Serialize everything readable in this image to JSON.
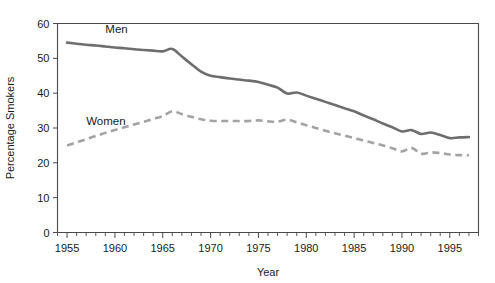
{
  "chart_data": {
    "type": "line",
    "title": "",
    "xlabel": "Year",
    "ylabel": "Percentage Smokers",
    "xlim": [
      1954,
      1998
    ],
    "ylim": [
      0,
      60
    ],
    "grid": false,
    "legend_position": "inline-annotation",
    "y_ticks": [
      0,
      10,
      20,
      30,
      40,
      50,
      60
    ],
    "x_ticks": [
      1955,
      1960,
      1965,
      1970,
      1975,
      1980,
      1985,
      1990,
      1995
    ],
    "x_minor_tick_interval": 1,
    "x": [
      1955,
      1956,
      1957,
      1958,
      1959,
      1960,
      1961,
      1962,
      1963,
      1964,
      1965,
      1966,
      1967,
      1968,
      1969,
      1970,
      1971,
      1972,
      1973,
      1974,
      1975,
      1976,
      1977,
      1978,
      1979,
      1980,
      1981,
      1982,
      1983,
      1984,
      1985,
      1986,
      1987,
      1988,
      1989,
      1990,
      1991,
      1992,
      1993,
      1994,
      1995,
      1996,
      1997
    ],
    "series": [
      {
        "name": "Men",
        "label": "Men",
        "style": "solid",
        "color": "#6e6e6e",
        "values": [
          54.5,
          54.2,
          53.9,
          53.7,
          53.4,
          53.1,
          52.9,
          52.6,
          52.4,
          52.2,
          52.0,
          52.7,
          50.5,
          48.3,
          46.2,
          45.0,
          44.6,
          44.2,
          43.9,
          43.6,
          43.2,
          42.4,
          41.6,
          39.9,
          40.2,
          39.3,
          38.4,
          37.5,
          36.6,
          35.7,
          34.8,
          33.6,
          32.5,
          31.3,
          30.2,
          29.0,
          29.4,
          28.3,
          28.7,
          28.0,
          27.1,
          27.3,
          27.4
        ]
      },
      {
        "name": "Women",
        "label": "Women",
        "style": "dashed",
        "color": "#a3a3a3",
        "values": [
          25.0,
          25.9,
          26.8,
          27.7,
          28.6,
          29.4,
          30.2,
          31.0,
          31.8,
          32.6,
          33.4,
          34.8,
          34.0,
          33.2,
          32.5,
          32.1,
          32.0,
          32.0,
          32.0,
          32.0,
          32.2,
          31.9,
          31.8,
          32.4,
          31.6,
          30.8,
          30.0,
          29.2,
          28.5,
          27.8,
          27.1,
          26.4,
          25.7,
          25.0,
          24.2,
          23.3,
          24.3,
          22.6,
          23.0,
          22.8,
          22.4,
          22.2,
          22.2
        ]
      }
    ],
    "annotations": [
      {
        "text": "Men",
        "x": 1959.0,
        "y": 57.2
      },
      {
        "text": "Women",
        "x": 1957.0,
        "y": 31.0
      }
    ]
  }
}
